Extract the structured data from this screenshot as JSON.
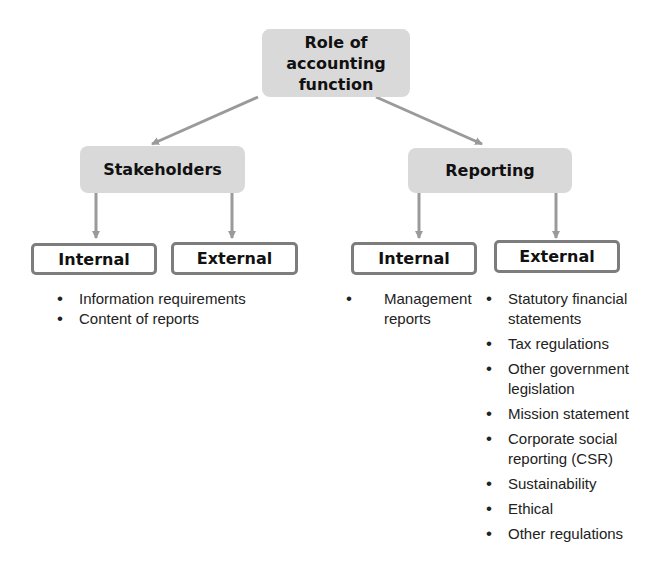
{
  "diagram": {
    "root": {
      "label": "Role of accounting function",
      "line1": "Role of accounting",
      "line2": "function"
    },
    "branches": [
      {
        "label": "Stakeholders",
        "children": [
          {
            "label": "Internal",
            "items": [
              "Information requirements",
              "Content of reports"
            ]
          },
          {
            "label": "External",
            "items": []
          }
        ]
      },
      {
        "label": "Reporting",
        "children": [
          {
            "label": "Internal",
            "items": [
              "Management reports"
            ]
          },
          {
            "label": "External",
            "items": [
              "Statutory financial statements",
              "Tax regulations",
              "Other government legislation",
              "Mission statement",
              "Corporate social reporting (CSR)",
              "Sustainability",
              "Ethical",
              "Other regulations"
            ]
          }
        ]
      }
    ],
    "colors": {
      "grey_box": "#d9d9d9",
      "outline": "#7d7d7d",
      "arrow": "#9a9a9a",
      "text": "#111111"
    }
  }
}
